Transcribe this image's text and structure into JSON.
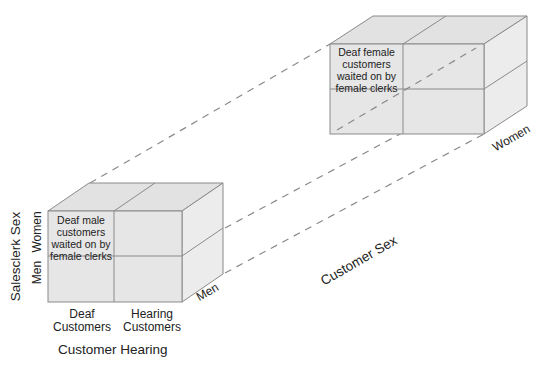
{
  "diagram": {
    "type": "3d-factorial-design-cube",
    "front_cube": {
      "customer_sex": "Men",
      "highlight_cell": "Deaf male customers waited on by female clerks",
      "highlight_lines": [
        "Deaf male",
        "customers",
        "waited on by",
        "female clerks"
      ]
    },
    "back_cube": {
      "customer_sex": "Women",
      "highlight_cell": "Deaf female customers waited on by female clerks",
      "highlight_lines": [
        "Deaf female",
        "customers",
        "waited on by",
        "female clerks"
      ]
    },
    "axes": {
      "x_title": "Customer Hearing",
      "x_levels": [
        [
          "Deaf",
          "Customers"
        ],
        [
          "Hearing",
          "Customers"
        ]
      ],
      "y_title": "Salesclerk Sex",
      "y_levels": [
        "Men",
        "Women"
      ],
      "z_title": "Customer Sex",
      "z_levels": [
        "Men",
        "Women"
      ]
    },
    "colors": {
      "face": "#e6e6e6",
      "side": "#ececec",
      "top": "#e2e2e2",
      "edge": "#888888",
      "dash": "#888888"
    }
  }
}
